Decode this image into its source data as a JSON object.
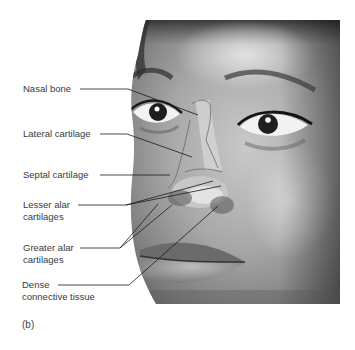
{
  "figure": {
    "panel_label": "(b)",
    "labels": [
      {
        "id": "nasal-bone",
        "lines": [
          "Nasal bone"
        ]
      },
      {
        "id": "lateral-cartilage",
        "lines": [
          "Lateral cartilage"
        ]
      },
      {
        "id": "septal-cartilage",
        "lines": [
          "Septal cartilage"
        ]
      },
      {
        "id": "lesser-alar-cartilages",
        "lines": [
          "Lesser alar",
          "cartilages"
        ]
      },
      {
        "id": "greater-alar-cartilages",
        "lines": [
          "Greater alar",
          "cartilages"
        ]
      },
      {
        "id": "dense-connective-tissue",
        "lines": [
          "Dense",
          "connective tissue"
        ]
      }
    ],
    "colors": {
      "background": "#ffffff",
      "text": "#3a3a3a",
      "leader_line": "#1a1a1a"
    }
  }
}
